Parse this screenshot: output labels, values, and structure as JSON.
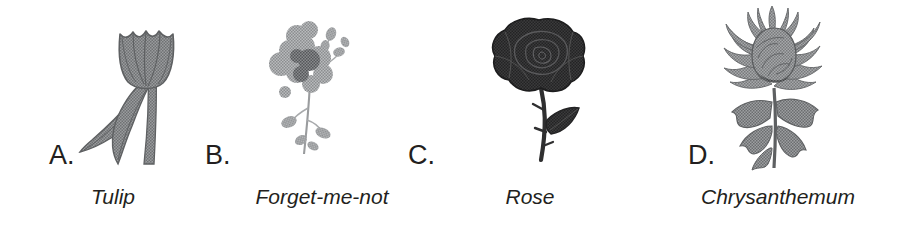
{
  "page": {
    "background_color": "#ffffff",
    "ink_color": "#231f20",
    "kind": "multiple-choice-figure-row",
    "option_count": 4
  },
  "options": [
    {
      "letter": "A.",
      "caption": "Tulip",
      "icon": "tulip-illustration",
      "art_tone": "#6f7173",
      "art_description": "Line-drawn tulip with a closed cup-shaped bloom, upright stem and two long sweeping leaves"
    },
    {
      "letter": "B.",
      "caption": "Forget-me-not",
      "icon": "forget-me-not-illustration",
      "art_tone": "#8b8d8f",
      "art_description": "Soft grey cluster of small five-petal blossoms on a slender branching stem with buds"
    },
    {
      "letter": "C.",
      "caption": "Rose",
      "icon": "rose-illustration",
      "art_tone": "#2f2f30",
      "art_description": "Dark solid rose bloom with layered petals on a thorny stem bearing one leaf"
    },
    {
      "letter": "D.",
      "caption": "Chrysanthemum",
      "icon": "chrysanthemum-illustration",
      "art_tone": "#78797b",
      "art_description": "Shaggy spider chrysanthemum with many curling narrow petals above jagged foliage"
    }
  ]
}
